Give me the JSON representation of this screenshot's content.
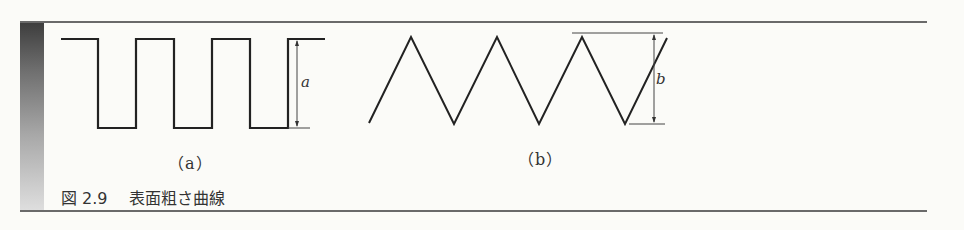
{
  "figure": {
    "caption_number": "図 2.9",
    "caption_title": "表面粗さ曲線",
    "panels": [
      {
        "id": "a",
        "label": "（a）",
        "waveform": "square",
        "dimension_label": "a"
      },
      {
        "id": "b",
        "label": "（b）",
        "waveform": "triangle",
        "dimension_label": "b"
      }
    ],
    "colors": {
      "line": "#222222",
      "rule": "#6a6a6a",
      "background": "#fbfbf8"
    }
  }
}
